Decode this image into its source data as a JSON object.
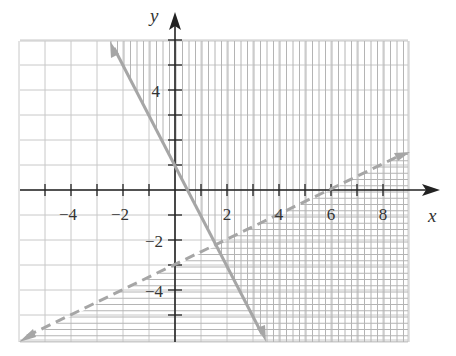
{
  "chart_data": {
    "type": "line",
    "title": "",
    "xlabel": "x",
    "ylabel": "y",
    "xlim": [
      -6,
      9
    ],
    "ylim": [
      -6,
      6
    ],
    "grid": true,
    "x_tick_labels": [
      "−4",
      "−2",
      "2",
      "4",
      "6",
      "8"
    ],
    "x_tick_values": [
      -4,
      -2,
      2,
      4,
      6,
      8
    ],
    "y_tick_labels": [
      "4",
      "−2",
      "−4"
    ],
    "y_tick_values": [
      4,
      -2,
      -4
    ],
    "series": [
      {
        "name": "solid boundary",
        "equation": "y = -2x + 1",
        "style": "solid",
        "x": [
          -2.5,
          3.5
        ],
        "y": [
          6,
          -6
        ],
        "shading": "vertical hatch on right side (2x + y ≥ 1)"
      },
      {
        "name": "dashed boundary",
        "equation": "y = x/2 - 3",
        "style": "dashed",
        "x": [
          -6,
          9
        ],
        "y": [
          -6,
          1.5
        ],
        "shading": "horizontal hatch below (y < x/2 - 3)"
      }
    ],
    "colors": {
      "grid": "#c8c8c8",
      "hatch": "#b4b4b4",
      "boundary": "#a6a6a6",
      "axis": "#222222"
    }
  }
}
